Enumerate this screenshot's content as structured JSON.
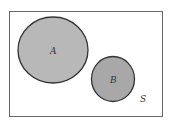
{
  "diagram": {
    "type": "venn",
    "universe_label": "S",
    "sets": [
      {
        "label": "A",
        "fill": "#b8b8b8"
      },
      {
        "label": "B",
        "fill": "#a8a8a8"
      }
    ],
    "relationship": "disjoint",
    "colors": {
      "border": "#444444",
      "background": "#ffffff"
    }
  }
}
